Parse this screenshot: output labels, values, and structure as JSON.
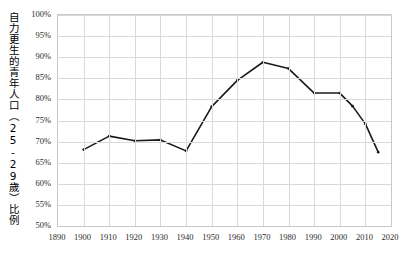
{
  "chart_data": {
    "type": "line",
    "title": "",
    "xlabel": "",
    "ylabel": "自力更生的青年人口（25-29歲）比例",
    "xlim": [
      1890,
      2020
    ],
    "ylim": [
      0.5,
      1.0
    ],
    "grid": true,
    "legend": "none",
    "x_ticks": [
      "1890",
      "1900",
      "1910",
      "1920",
      "1930",
      "1940",
      "1950",
      "1960",
      "1970",
      "1980",
      "1990",
      "2000",
      "2010",
      "2020"
    ],
    "y_ticks": [
      "50%",
      "55%",
      "60%",
      "65%",
      "70%",
      "75%",
      "80%",
      "85%",
      "90%",
      "95%",
      "100%"
    ],
    "x": [
      1900,
      1910,
      1920,
      1930,
      1940,
      1950,
      1960,
      1970,
      1980,
      1990,
      2000,
      2005,
      2010,
      2015
    ],
    "values": [
      0.681,
      0.713,
      0.702,
      0.704,
      0.678,
      0.783,
      0.845,
      0.888,
      0.873,
      0.815,
      0.815,
      0.784,
      0.742,
      0.675
    ],
    "series": [
      {
        "name": "自力更生的青年人口（25-29歲）比例",
        "color": "#1a1a1a",
        "values": [
          0.681,
          0.713,
          0.702,
          0.704,
          0.678,
          0.783,
          0.845,
          0.888,
          0.873,
          0.815,
          0.815,
          0.784,
          0.742,
          0.675
        ]
      }
    ]
  },
  "axis": {
    "y_title": "自力更生的青年人口（25-29歲）比例"
  }
}
